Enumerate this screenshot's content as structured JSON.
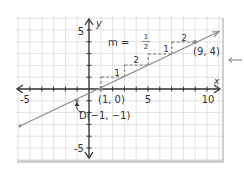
{
  "figure": {
    "axes": {
      "x_label": "x",
      "y_label": "y",
      "x_ticks": [
        {
          "value": -5,
          "label": "-5"
        },
        {
          "value": 5,
          "label": "5"
        },
        {
          "value": 10,
          "label": "10"
        }
      ],
      "y_ticks": [
        {
          "value": 5,
          "label": "5"
        },
        {
          "value": -5,
          "label": "-5"
        }
      ]
    },
    "slope_label": {
      "prefix": "m =",
      "numerator": "1",
      "denominator": "2"
    },
    "points": [
      {
        "name": "point-1-0",
        "x": 1,
        "y": 0,
        "label": "(1, 0)"
      },
      {
        "name": "point-9-4",
        "x": 9,
        "y": 4,
        "label": "(9, 4)"
      },
      {
        "name": "point-D",
        "x": -1,
        "y": -1,
        "label": "D(−1, −1)"
      }
    ],
    "steps": [
      {
        "run": "2",
        "rise": "1"
      },
      {
        "run": "2",
        "rise": "1"
      },
      {
        "run": "2",
        "rise": "1"
      },
      {
        "run": "2",
        "rise": "1"
      }
    ],
    "colors": {
      "grid": "#d9d9d9",
      "axis": "#333333",
      "line": "#8a8a8a",
      "frame_shadow": "#c8c8c8"
    }
  }
}
